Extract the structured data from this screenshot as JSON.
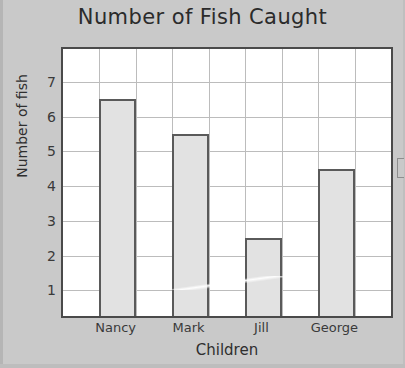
{
  "chart_data": {
    "type": "bar",
    "title": "Number of Fish Caught",
    "xlabel": "Children",
    "ylabel": "Number of fish",
    "categories": [
      "Nancy",
      "Mark",
      "Jill",
      "George"
    ],
    "values": [
      6.5,
      5.5,
      2.5,
      4.5
    ],
    "yticks": [
      1,
      2,
      3,
      4,
      5,
      6,
      7
    ],
    "ylim": [
      0.26,
      7.95
    ],
    "grid": true,
    "legend": "none",
    "bar_fill": "#e2e2e2",
    "bar_edge": "#5a5a5a",
    "grid_color": "#bcbcbc",
    "plot_background": "#ffffff",
    "page_background": "#c9c9c9",
    "gridlines_vertical": 8
  }
}
